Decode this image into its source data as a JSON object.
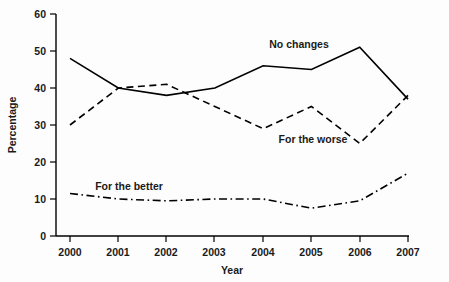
{
  "chart_data": {
    "type": "line",
    "title": "",
    "xlabel": "Year",
    "ylabel": "Percentage",
    "categories": [
      "2000",
      "2001",
      "2002",
      "2003",
      "2004",
      "2005",
      "2006",
      "2007"
    ],
    "x": [
      2000,
      2001,
      2002,
      2003,
      2004,
      2005,
      2006,
      2007
    ],
    "xlim": [
      2000,
      2007
    ],
    "ylim": [
      0,
      60
    ],
    "yticks": [
      0,
      10,
      20,
      30,
      40,
      50,
      60
    ],
    "ytick_labels": [
      "0",
      "10",
      "20",
      "30",
      "40",
      "50",
      "60"
    ],
    "grid": false,
    "legend": "inline-annotations",
    "series": [
      {
        "name": "No changes",
        "style": "solid",
        "color": "#000000",
        "values": [
          48,
          40,
          38,
          40,
          46,
          45,
          51,
          37
        ]
      },
      {
        "name": "For the worse",
        "style": "dashed",
        "color": "#000000",
        "values": [
          30,
          40,
          41,
          35,
          29,
          35,
          25,
          38
        ]
      },
      {
        "name": "For the better",
        "style": "dash-dot",
        "color": "#000000",
        "values": [
          11.5,
          10,
          9.5,
          10,
          10,
          7.5,
          9.5,
          17
        ]
      }
    ],
    "annotations": [
      {
        "text": "No changes",
        "x_px": 299,
        "y_px": 48
      },
      {
        "text": "For the worse",
        "x_px": 313,
        "y_px": 143
      },
      {
        "text": "For the better",
        "x_px": 129,
        "y_px": 190
      }
    ]
  }
}
